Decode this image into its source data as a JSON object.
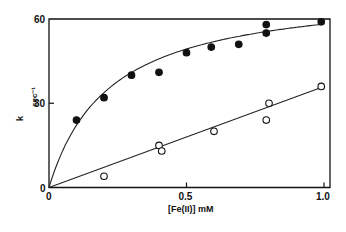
{
  "chart_data": {
    "type": "scatter",
    "title": "",
    "xlabel": "[Fe(II)]  mM",
    "ylabel": "k  sec⁻¹",
    "xlim": [
      0,
      1.0
    ],
    "ylim": [
      0,
      60
    ],
    "x_ticks": [
      {
        "value": 0,
        "label": "0"
      },
      {
        "value": 0.5,
        "label": "0.5"
      },
      {
        "value": 1.0,
        "label": "1.0"
      }
    ],
    "y_ticks": [
      {
        "value": 0,
        "label": "0"
      },
      {
        "value": 30,
        "label": "30"
      },
      {
        "value": 60,
        "label": "60"
      }
    ],
    "grid": false,
    "legend": null,
    "series": [
      {
        "name": "filled circles",
        "marker": "filled-circle",
        "fit": {
          "type": "hyperbolic",
          "kmax": 71,
          "K": 0.22
        },
        "x": [
          0.1,
          0.2,
          0.3,
          0.4,
          0.5,
          0.59,
          0.69,
          0.79,
          0.79,
          0.99
        ],
        "y": [
          24,
          32,
          40,
          41,
          48,
          50,
          51,
          58,
          55,
          59
        ]
      },
      {
        "name": "open circles",
        "marker": "open-circle",
        "fit": {
          "type": "linear",
          "slope": 36,
          "intercept": 0
        },
        "x": [
          0.2,
          0.4,
          0.41,
          0.6,
          0.8,
          0.79,
          0.99
        ],
        "y": [
          4,
          15,
          13,
          20,
          30,
          24,
          36
        ]
      }
    ]
  },
  "axes": {
    "x_label": "[Fe(II)]  mM",
    "y_label_k": "k",
    "y_label_unit": "sec⁻¹"
  }
}
